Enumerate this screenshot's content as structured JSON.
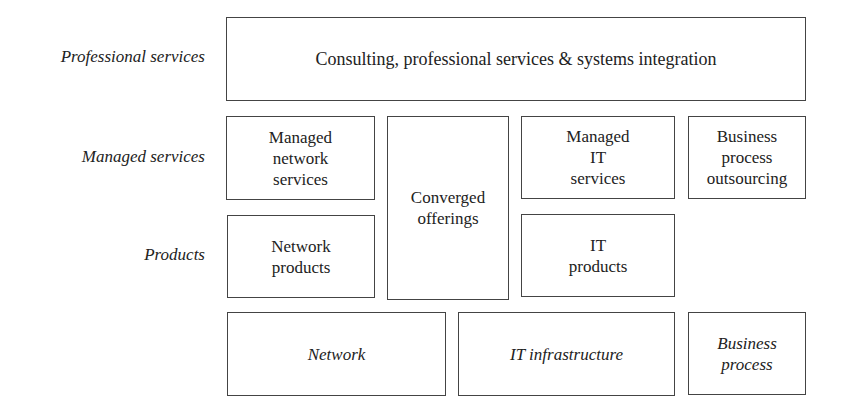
{
  "row_labels": {
    "professional": "Professional services",
    "managed": "Managed services",
    "products": "Products"
  },
  "boxes": {
    "consulting": "Consulting, professional services & systems integration",
    "managed_network": "Managed\nnetwork\nservices",
    "converged": "Converged\nofferings",
    "managed_it": "Managed\nIT\nservices",
    "bpo": "Business\nprocess\noutsourcing",
    "network_products": "Network\nproducts",
    "it_products": "IT\nproducts",
    "network": "Network",
    "it_infrastructure": "IT infrastructure",
    "business_process": "Business\nprocess"
  }
}
